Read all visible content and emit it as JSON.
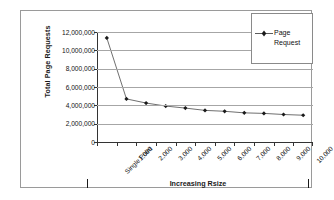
{
  "chart_data": {
    "type": "line",
    "title": "",
    "xlabel": "Increasing Rsize",
    "ylabel": "Total Page Requests",
    "categories": [
      "Single Point",
      "1,000",
      "2,000",
      "3,000",
      "4,000",
      "5,000",
      "6,000",
      "7,000",
      "8,000",
      "9,000",
      "10,000"
    ],
    "series": [
      {
        "name": "Page Request",
        "values": [
          11350000,
          4700000,
          4250000,
          3920000,
          3700000,
          3450000,
          3350000,
          3180000,
          3120000,
          3000000,
          2920000
        ]
      }
    ],
    "ylim": [
      0,
      12000000
    ],
    "ytick_labels": [
      "12,000,000",
      "10,000,000",
      "8,000,000",
      "6,000,000",
      "4,000,000",
      "2,000,000",
      "0"
    ],
    "ytick_values": [
      12000000,
      10000000,
      8000000,
      6000000,
      4000000,
      2000000,
      0
    ],
    "grid": true,
    "legend_position": "top-right",
    "marker": "diamond",
    "line_color": "#4a4a4a",
    "marker_color": "#1a1a1a"
  },
  "legend": {
    "entries": [
      {
        "label": "Page\nRequest"
      }
    ]
  },
  "axis_end_marks": {
    "left": "|",
    "right": "|"
  }
}
